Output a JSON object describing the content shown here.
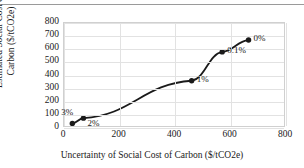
{
  "chart_data": {
    "type": "line",
    "title": "",
    "xlabel": "Uncertainty of Social Cost of Carbon ($/tCO2e)",
    "ylabel_line1": "Estimated Social Cost of",
    "ylabel_line2": "Carbon ($/tCO2e)",
    "xlim": [
      0,
      800
    ],
    "ylim": [
      0,
      800
    ],
    "xticks": [
      0,
      200,
      400,
      600,
      800
    ],
    "yticks": [
      0,
      100,
      200,
      300,
      400,
      500,
      600,
      700,
      800
    ],
    "grid": true,
    "legend": "none",
    "marker": "filled-circle",
    "series_color": "#1a1a1a",
    "grid_color": "#e2e2e2",
    "points": [
      {
        "x": 30,
        "y": 35,
        "label": "3%",
        "label_pos": "above-left"
      },
      {
        "x": 70,
        "y": 75,
        "label": "2%",
        "label_pos": "below-right"
      },
      {
        "x": 460,
        "y": 360,
        "label": "1%",
        "label_pos": "right"
      },
      {
        "x": 570,
        "y": 580,
        "label": "0.1%",
        "label_pos": "right"
      },
      {
        "x": 665,
        "y": 670,
        "label": "0%",
        "label_pos": "right"
      }
    ]
  }
}
